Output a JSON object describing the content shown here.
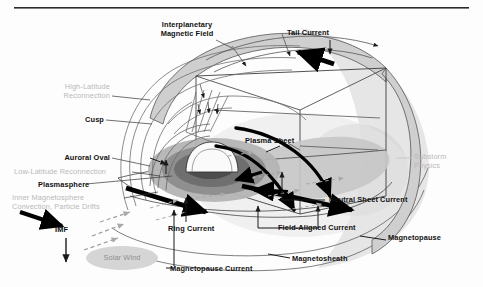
{
  "figure": {
    "domain": "scientific-diagram",
    "background_color": "#fdfdfd",
    "rule_color": "#2b2b2b",
    "label_color": "#111111",
    "gray_label_color": "#b9b9b9",
    "shell_gray": "#9a9a9a",
    "halo_gray": "#dcdcdc"
  },
  "labels": {
    "interplanetary_magnetic_field": "Interplanetary\nMagnetic Field",
    "interplanetary_line1": "Interplanetary",
    "interplanetary_line2": "Magnetic Field",
    "tail_current": "Tail Current",
    "high_latitude_reconnection_line1": "High-Latitude",
    "high_latitude_reconnection_line2": "Reconnection",
    "cusp": "Cusp",
    "plasma_sheet": "Plasma Sheet",
    "substorm_line1": "Substorm",
    "substorm_line2": "Physics",
    "auroral_oval": "Auroral Oval",
    "low_latitude_reconnection": "Low-Latitude Reconnection",
    "plasmasphere": "Plasmasphere",
    "inner_magnetosphere_line1": "Inner Magnetosphere",
    "inner_magnetosphere_line2": "Convection, Particle Drifts",
    "imf": "IMF",
    "solar_wind": "Solar Wind",
    "ring_current": "Ring Current",
    "magnetopause_current": "Magnetopause Current",
    "field_aligned_current": "Field-Aligned Current",
    "neutral_sheet_current": "Neutral Sheet Current",
    "magnetopause": "Magnetopause",
    "magnetosheath": "Magnetosheath"
  },
  "annotation_positions": {
    "interplanetary_magnetic_field": {
      "x": 183,
      "y": 26
    },
    "tail_current": {
      "x": 313,
      "y": 36
    },
    "high_latitude_reconnection": {
      "x": 100,
      "y": 86
    },
    "cusp": {
      "x": 89,
      "y": 119
    },
    "plasma_sheet": {
      "x": 251,
      "y": 140
    },
    "substorm_physics": {
      "x": 413,
      "y": 158
    },
    "auroral_oval": {
      "x": 66,
      "y": 158
    },
    "low_latitude_reconnection": {
      "x": 17,
      "y": 172
    },
    "plasmasphere": {
      "x": 41,
      "y": 184
    },
    "inner_magnetosphere": {
      "x": 15,
      "y": 196
    },
    "imf": {
      "x": 60,
      "y": 229
    },
    "solar_wind": {
      "x": 97,
      "y": 257
    },
    "ring_current": {
      "x": 174,
      "y": 227
    },
    "magnetopause_current": {
      "x": 167,
      "y": 270
    },
    "field_aligned_current": {
      "x": 278,
      "y": 226
    },
    "neutral_sheet_current": {
      "x": 327,
      "y": 199
    },
    "magnetopause": {
      "x": 389,
      "y": 237
    },
    "magnetosheath": {
      "x": 293,
      "y": 258
    }
  }
}
